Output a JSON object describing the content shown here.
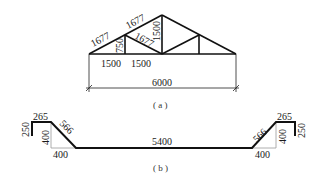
{
  "figure_a": {
    "caption": "( a )",
    "member_lengths": {
      "top_chord_left_lower": "1677",
      "top_chord_left_upper": "1677",
      "diagonal_left": "1677",
      "vertical_short": "750",
      "vertical_center": "1500"
    },
    "panel_dimensions": [
      "1500",
      "1500"
    ],
    "overall_span": "6000"
  },
  "figure_b": {
    "caption": "( b )",
    "left": {
      "lip_height": "250",
      "flange_width": "265",
      "slope_length": "566",
      "depth": "400",
      "slope_horizontal": "400"
    },
    "bottom_length": "5400",
    "right": {
      "lip_height": "250",
      "flange_width": "265",
      "slope_length": "566",
      "depth": "400",
      "slope_horizontal": "400"
    }
  }
}
